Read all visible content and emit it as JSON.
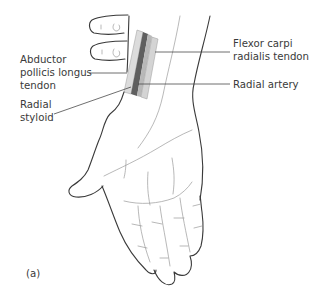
{
  "figure": {
    "panel_label": "(a)",
    "labels": {
      "abductor": [
        "Abductor",
        "pollicis longus",
        "tendon"
      ],
      "radial_styloid": [
        "Radial",
        "styloid"
      ],
      "flexor": [
        "Flexor carpi",
        "radialis tendon"
      ],
      "radial_artery": [
        "Radial artery"
      ]
    },
    "colors": {
      "outline": "#3a3a3a",
      "tendon_light": "#d8d8d8",
      "tendon_mid": "#b4b4b4",
      "artery_dark": "#5a5a5a",
      "leader": "#4a4a4a",
      "text": "#3a3a3a"
    }
  }
}
